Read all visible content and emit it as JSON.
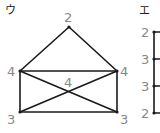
{
  "panels": [
    {
      "label": "ウ",
      "vertices": [
        {
          "id": "top",
          "degree": "2"
        },
        {
          "id": "upper-left",
          "degree": "4"
        },
        {
          "id": "upper-right",
          "degree": "4"
        },
        {
          "id": "lower-left",
          "degree": "3"
        },
        {
          "id": "lower-right",
          "degree": "3"
        },
        {
          "id": "center",
          "degree": "4"
        }
      ],
      "edges": [
        [
          "top",
          "upper-left"
        ],
        [
          "top",
          "upper-right"
        ],
        [
          "upper-left",
          "upper-right"
        ],
        [
          "upper-left",
          "lower-left"
        ],
        [
          "upper-right",
          "lower-right"
        ],
        [
          "lower-left",
          "lower-right"
        ],
        [
          "upper-left",
          "lower-right"
        ],
        [
          "upper-right",
          "lower-left"
        ]
      ]
    },
    {
      "label": "エ",
      "vertices": [
        {
          "id": "v1",
          "degree": "2"
        },
        {
          "id": "v2",
          "degree": "3"
        },
        {
          "id": "v3",
          "degree": "3"
        },
        {
          "id": "v4",
          "degree": "2"
        }
      ]
    }
  ]
}
